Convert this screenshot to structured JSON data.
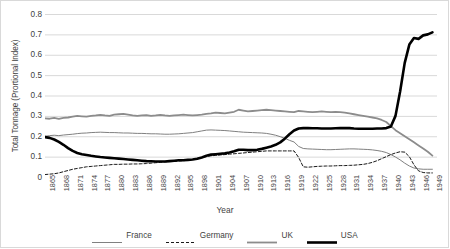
{
  "chart_data": {
    "type": "line",
    "title": "",
    "xlabel": "Year",
    "ylabel": "Total Tonnage (Prortional Index)",
    "xlim": [
      1865,
      1950
    ],
    "ylim": [
      0,
      0.8
    ],
    "grid": true,
    "legend_position": "bottom",
    "ytick_labels": [
      "0.8",
      "0.7",
      "0.6",
      "0.5",
      "0.4",
      "0.3",
      "0.2",
      "0.1",
      "0"
    ],
    "ytick_values": [
      0.8,
      0.7,
      0.6,
      0.5,
      0.4,
      0.3,
      0.2,
      0.1,
      0
    ],
    "xtick_labels": [
      "1865",
      "1868",
      "1871",
      "1874",
      "1877",
      "1880",
      "1883",
      "1886",
      "1889",
      "1892",
      "1895",
      "1898",
      "1901",
      "1904",
      "1907",
      "1910",
      "1913",
      "1916",
      "1919",
      "1922",
      "1925",
      "1928",
      "1931",
      "1934",
      "1937",
      "1940",
      "1943",
      "1946",
      "1949"
    ],
    "x": [
      1865,
      1866,
      1867,
      1868,
      1869,
      1870,
      1871,
      1872,
      1873,
      1874,
      1875,
      1876,
      1877,
      1878,
      1879,
      1880,
      1881,
      1882,
      1883,
      1884,
      1885,
      1886,
      1887,
      1888,
      1889,
      1890,
      1891,
      1892,
      1893,
      1894,
      1895,
      1896,
      1897,
      1898,
      1899,
      1900,
      1901,
      1902,
      1903,
      1904,
      1905,
      1906,
      1907,
      1908,
      1909,
      1910,
      1911,
      1912,
      1913,
      1914,
      1915,
      1916,
      1917,
      1918,
      1919,
      1920,
      1921,
      1922,
      1923,
      1924,
      1925,
      1926,
      1927,
      1928,
      1929,
      1930,
      1931,
      1932,
      1933,
      1934,
      1935,
      1936,
      1937,
      1938,
      1939,
      1940,
      1941,
      1942,
      1943,
      1944,
      1945,
      1946,
      1947,
      1948,
      1949
    ],
    "series": [
      {
        "name": "France",
        "color": "#808080",
        "style": "solid",
        "width": 1.0,
        "values": [
          0.2,
          0.203,
          0.205,
          0.203,
          0.206,
          0.208,
          0.21,
          0.213,
          0.215,
          0.216,
          0.218,
          0.219,
          0.22,
          0.219,
          0.218,
          0.218,
          0.217,
          0.216,
          0.216,
          0.215,
          0.214,
          0.214,
          0.213,
          0.212,
          0.212,
          0.211,
          0.21,
          0.21,
          0.211,
          0.212,
          0.214,
          0.216,
          0.218,
          0.222,
          0.226,
          0.23,
          0.231,
          0.23,
          0.229,
          0.228,
          0.226,
          0.224,
          0.222,
          0.22,
          0.219,
          0.218,
          0.217,
          0.216,
          0.214,
          0.21,
          0.205,
          0.198,
          0.19,
          0.18,
          0.172,
          0.15,
          0.14,
          0.138,
          0.137,
          0.136,
          0.135,
          0.134,
          0.134,
          0.135,
          0.136,
          0.137,
          0.138,
          0.138,
          0.137,
          0.136,
          0.135,
          0.133,
          0.13,
          0.126,
          0.12,
          0.11,
          0.098,
          0.084,
          0.068,
          0.054,
          0.044,
          0.04,
          0.038,
          0.038,
          0.038
        ]
      },
      {
        "name": "Germany",
        "color": "#1a1a1a",
        "style": "dashed",
        "width": 1.0,
        "values": [
          0.012,
          0.014,
          0.016,
          0.02,
          0.026,
          0.032,
          0.038,
          0.042,
          0.046,
          0.05,
          0.052,
          0.054,
          0.056,
          0.058,
          0.06,
          0.062,
          0.062,
          0.063,
          0.063,
          0.064,
          0.064,
          0.065,
          0.066,
          0.068,
          0.07,
          0.072,
          0.074,
          0.076,
          0.076,
          0.078,
          0.08,
          0.082,
          0.086,
          0.092,
          0.096,
          0.1,
          0.104,
          0.106,
          0.108,
          0.11,
          0.112,
          0.114,
          0.116,
          0.118,
          0.12,
          0.122,
          0.124,
          0.126,
          0.128,
          0.128,
          0.128,
          0.128,
          0.128,
          0.128,
          0.128,
          0.096,
          0.05,
          0.048,
          0.05,
          0.052,
          0.053,
          0.054,
          0.054,
          0.055,
          0.056,
          0.056,
          0.057,
          0.058,
          0.06,
          0.062,
          0.066,
          0.072,
          0.08,
          0.09,
          0.1,
          0.11,
          0.118,
          0.124,
          0.122,
          0.1,
          0.06,
          0.03,
          0.022,
          0.02,
          0.02
        ]
      },
      {
        "name": "UK",
        "color": "#8c8c8c",
        "style": "solid",
        "width": 1.8,
        "values": [
          0.288,
          0.286,
          0.29,
          0.285,
          0.29,
          0.292,
          0.296,
          0.3,
          0.298,
          0.296,
          0.3,
          0.302,
          0.305,
          0.302,
          0.3,
          0.306,
          0.308,
          0.31,
          0.306,
          0.302,
          0.3,
          0.302,
          0.304,
          0.3,
          0.302,
          0.305,
          0.302,
          0.3,
          0.302,
          0.304,
          0.306,
          0.304,
          0.302,
          0.304,
          0.306,
          0.31,
          0.312,
          0.316,
          0.314,
          0.312,
          0.316,
          0.32,
          0.33,
          0.326,
          0.322,
          0.324,
          0.326,
          0.328,
          0.33,
          0.328,
          0.326,
          0.324,
          0.322,
          0.32,
          0.318,
          0.324,
          0.322,
          0.32,
          0.318,
          0.32,
          0.322,
          0.32,
          0.318,
          0.32,
          0.318,
          0.316,
          0.312,
          0.308,
          0.304,
          0.3,
          0.296,
          0.292,
          0.288,
          0.28,
          0.27,
          0.25,
          0.23,
          0.215,
          0.2,
          0.185,
          0.17,
          0.155,
          0.14,
          0.124,
          0.105
        ]
      },
      {
        "name": "USA",
        "color": "#000000",
        "style": "solid",
        "width": 2.6,
        "values": [
          0.196,
          0.192,
          0.184,
          0.172,
          0.158,
          0.142,
          0.128,
          0.118,
          0.112,
          0.108,
          0.104,
          0.101,
          0.098,
          0.096,
          0.094,
          0.092,
          0.09,
          0.088,
          0.086,
          0.084,
          0.082,
          0.08,
          0.078,
          0.077,
          0.076,
          0.076,
          0.076,
          0.078,
          0.08,
          0.082,
          0.082,
          0.084,
          0.086,
          0.09,
          0.096,
          0.104,
          0.11,
          0.112,
          0.114,
          0.116,
          0.12,
          0.126,
          0.134,
          0.134,
          0.132,
          0.132,
          0.134,
          0.138,
          0.144,
          0.15,
          0.158,
          0.17,
          0.188,
          0.21,
          0.228,
          0.238,
          0.24,
          0.24,
          0.239,
          0.239,
          0.238,
          0.238,
          0.238,
          0.239,
          0.24,
          0.24,
          0.24,
          0.238,
          0.237,
          0.237,
          0.237,
          0.237,
          0.238,
          0.238,
          0.24,
          0.248,
          0.3,
          0.42,
          0.56,
          0.65,
          0.682,
          0.678,
          0.695,
          0.7,
          0.71
        ]
      }
    ]
  }
}
